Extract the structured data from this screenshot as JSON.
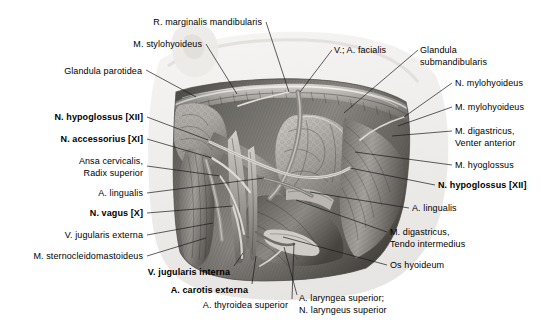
{
  "figure": {
    "kind": "anatomical-illustration",
    "style": "grayscale halftone drawing",
    "colors": {
      "background": "#ffffff",
      "label_text": "#000000",
      "leader_line": "#1a1a1a",
      "tissue_dark": "#4a4845",
      "tissue_mid": "#8b8884",
      "tissue_light": "#c9c6c1",
      "gland_tone": "#a8a5a0",
      "shadow": "#e6e4e1"
    }
  },
  "labels": [
    {
      "id": "r-marginalis-mandibularis",
      "lines": [
        "R. marginalis mandibularis"
      ],
      "bold": false,
      "side": "top",
      "x": 262,
      "y": 17,
      "anchor": "right"
    },
    {
      "id": "m-stylohyoideus",
      "lines": [
        "M. stylohyoideus"
      ],
      "bold": false,
      "side": "top",
      "x": 202,
      "y": 39,
      "anchor": "right"
    },
    {
      "id": "v-a-facialis",
      "lines": [
        "V.; A. facialis"
      ],
      "bold": false,
      "side": "top",
      "x": 334,
      "y": 45,
      "anchor": "left"
    },
    {
      "id": "glandula-submandibularis",
      "lines": [
        "Glandula",
        "submandibularis"
      ],
      "bold": false,
      "side": "right",
      "x": 420,
      "y": 45,
      "anchor": "left"
    },
    {
      "id": "glandula-parotidea",
      "lines": [
        "Glandula parotidea"
      ],
      "bold": false,
      "side": "left",
      "x": 142,
      "y": 66,
      "anchor": "right"
    },
    {
      "id": "n-mylohyoideus",
      "lines": [
        "N. mylohyoideus"
      ],
      "bold": false,
      "side": "right",
      "x": 455,
      "y": 78,
      "anchor": "left"
    },
    {
      "id": "m-mylohyoideus",
      "lines": [
        "M. mylohyoideus"
      ],
      "bold": false,
      "side": "right",
      "x": 455,
      "y": 102,
      "anchor": "left"
    },
    {
      "id": "n-hypoglossus-xii-left",
      "lines": [
        "N. hypoglossus [XII]"
      ],
      "bold": true,
      "side": "left",
      "x": 143,
      "y": 112,
      "anchor": "right"
    },
    {
      "id": "m-digastricus-venter-anterior",
      "lines": [
        "M. digastricus,",
        "Venter anterior"
      ],
      "bold": false,
      "side": "right",
      "x": 455,
      "y": 126,
      "anchor": "left"
    },
    {
      "id": "n-accessorius-xi",
      "lines": [
        "N. accessorius [XI]"
      ],
      "bold": true,
      "side": "left",
      "x": 143,
      "y": 134,
      "anchor": "right"
    },
    {
      "id": "m-hyoglossus",
      "lines": [
        "M. hyoglossus"
      ],
      "bold": false,
      "side": "right",
      "x": 455,
      "y": 160,
      "anchor": "left"
    },
    {
      "id": "ansa-cervicalis-radix-superior",
      "lines": [
        "Ansa cervicalis,",
        "Radix superior"
      ],
      "bold": false,
      "side": "left",
      "x": 143,
      "y": 156,
      "anchor": "right"
    },
    {
      "id": "n-hypoglossus-xii-right",
      "lines": [
        "N. hypoglossus [XII]"
      ],
      "bold": true,
      "side": "right",
      "x": 438,
      "y": 180,
      "anchor": "left"
    },
    {
      "id": "a-lingualis-left",
      "lines": [
        "A. lingualis"
      ],
      "bold": false,
      "side": "left",
      "x": 143,
      "y": 188,
      "anchor": "right"
    },
    {
      "id": "a-lingualis-right",
      "lines": [
        "A. lingualis"
      ],
      "bold": false,
      "side": "right",
      "x": 412,
      "y": 203,
      "anchor": "left"
    },
    {
      "id": "n-vagus-x",
      "lines": [
        "N. vagus [X]"
      ],
      "bold": true,
      "side": "left",
      "x": 143,
      "y": 208,
      "anchor": "right"
    },
    {
      "id": "m-digastricus-tendo-intermedius",
      "lines": [
        "M. digastricus,",
        "Tendo intermedius"
      ],
      "bold": false,
      "side": "right",
      "x": 390,
      "y": 227,
      "anchor": "left"
    },
    {
      "id": "v-jugularis-externa",
      "lines": [
        "V. jugularis externa"
      ],
      "bold": false,
      "side": "left",
      "x": 143,
      "y": 230,
      "anchor": "right"
    },
    {
      "id": "m-sternocleidomastoideus",
      "lines": [
        "M. sternocleidomastoideus"
      ],
      "bold": false,
      "side": "left",
      "x": 143,
      "y": 251,
      "anchor": "right"
    },
    {
      "id": "os-hyoideum",
      "lines": [
        "Os hyoideum"
      ],
      "bold": false,
      "side": "right",
      "x": 390,
      "y": 260,
      "anchor": "left"
    },
    {
      "id": "v-jugularis-interna",
      "lines": [
        "V. jugularis interna"
      ],
      "bold": true,
      "side": "bottom",
      "x": 230,
      "y": 267,
      "anchor": "right"
    },
    {
      "id": "a-carotis-externa",
      "lines": [
        "A. carotis externa"
      ],
      "bold": true,
      "side": "bottom",
      "x": 248,
      "y": 285,
      "anchor": "right"
    },
    {
      "id": "a-thyroidea-superior",
      "lines": [
        "A. thyroidea superior"
      ],
      "bold": false,
      "side": "bottom",
      "x": 288,
      "y": 300,
      "anchor": "right"
    },
    {
      "id": "a-laryngea-n-laryngeus-superior",
      "lines": [
        "A. laryngea superior;",
        "N. laryngeus superior"
      ],
      "bold": false,
      "side": "bottom",
      "x": 299,
      "y": 293,
      "anchor": "left"
    }
  ],
  "leader_lines": [
    {
      "id": "leader-r-marginalis-mandibularis",
      "points": [
        [
          266,
          22
        ],
        [
          289,
          92
        ]
      ]
    },
    {
      "id": "leader-m-stylohyoideus",
      "points": [
        [
          206,
          44
        ],
        [
          237,
          94
        ]
      ]
    },
    {
      "id": "leader-v-a-facialis",
      "points": [
        [
          332,
          50
        ],
        [
          300,
          92
        ]
      ]
    },
    {
      "id": "leader-glandula-submandibularis",
      "points": [
        [
          418,
          50
        ],
        [
          344,
          113
        ]
      ]
    },
    {
      "id": "leader-glandula-parotidea",
      "points": [
        [
          146,
          70
        ],
        [
          196,
          97
        ]
      ]
    },
    {
      "id": "leader-n-mylohyoideus",
      "points": [
        [
          452,
          83
        ],
        [
          404,
          117
        ]
      ]
    },
    {
      "id": "leader-m-mylohyoideus",
      "points": [
        [
          452,
          107
        ],
        [
          398,
          126
        ]
      ]
    },
    {
      "id": "leader-n-hypoglossus-left",
      "points": [
        [
          147,
          117
        ],
        [
          208,
          140
        ]
      ]
    },
    {
      "id": "leader-m-digastricus-venter-anterior",
      "points": [
        [
          452,
          131
        ],
        [
          392,
          136
        ]
      ]
    },
    {
      "id": "leader-n-accessorius",
      "points": [
        [
          147,
          139
        ],
        [
          212,
          158
        ]
      ]
    },
    {
      "id": "leader-ansa-cervicalis",
      "points": [
        [
          147,
          166
        ],
        [
          220,
          176
        ]
      ]
    },
    {
      "id": "leader-m-hyoglossus",
      "points": [
        [
          452,
          165
        ],
        [
          355,
          152
        ]
      ]
    },
    {
      "id": "leader-a-lingualis-left",
      "points": [
        [
          147,
          193
        ],
        [
          264,
          178
        ]
      ]
    },
    {
      "id": "leader-n-hypoglossus-right",
      "points": [
        [
          435,
          185
        ],
        [
          350,
          168
        ]
      ]
    },
    {
      "id": "leader-a-lingualis-right",
      "points": [
        [
          409,
          208
        ],
        [
          310,
          192
        ]
      ]
    },
    {
      "id": "leader-n-vagus",
      "points": [
        [
          147,
          213
        ],
        [
          233,
          206
        ]
      ]
    },
    {
      "id": "leader-m-digastricus-tendo",
      "points": [
        [
          387,
          232
        ],
        [
          296,
          200
        ]
      ]
    },
    {
      "id": "leader-v-jugularis-externa",
      "points": [
        [
          147,
          235
        ],
        [
          213,
          223
        ]
      ]
    },
    {
      "id": "leader-m-sternocleidomastoideus",
      "points": [
        [
          147,
          256
        ],
        [
          206,
          238
        ]
      ]
    },
    {
      "id": "leader-os-hyoideum",
      "points": [
        [
          387,
          265
        ],
        [
          283,
          237
        ]
      ]
    },
    {
      "id": "leader-v-jugularis-interna",
      "points": [
        [
          234,
          266
        ],
        [
          243,
          253
        ]
      ]
    },
    {
      "id": "leader-a-carotis-externa",
      "points": [
        [
          252,
          284
        ],
        [
          256,
          256
        ]
      ]
    },
    {
      "id": "leader-a-thyroidea-superior",
      "points": [
        [
          292,
          299
        ],
        [
          294,
          243
        ]
      ]
    },
    {
      "id": "leader-a-laryngea-superior",
      "points": [
        [
          297,
          295
        ],
        [
          284,
          247
        ]
      ]
    }
  ],
  "chart_data": {
    "type": "table",
    "categories": [
      "R. marginalis mandibularis",
      "M. stylohyoideus",
      "V.; A. facialis",
      "Glandula submandibularis",
      "Glandula parotidea",
      "N. mylohyoideus",
      "M. mylohyoideus",
      "N. hypoglossus [XII]",
      "M. digastricus, Venter anterior",
      "N. accessorius [XI]",
      "Ansa cervicalis, Radix superior",
      "M. hyoglossus",
      "A. lingualis",
      "N. vagus [X]",
      "M. digastricus, Tendo intermedius",
      "V. jugularis externa",
      "M. sternocleidomastoideus",
      "Os hyoideum",
      "V. jugularis interna",
      "A. carotis externa",
      "A. thyroidea superior",
      "A. laryngea superior; N. laryngeus superior"
    ]
  }
}
